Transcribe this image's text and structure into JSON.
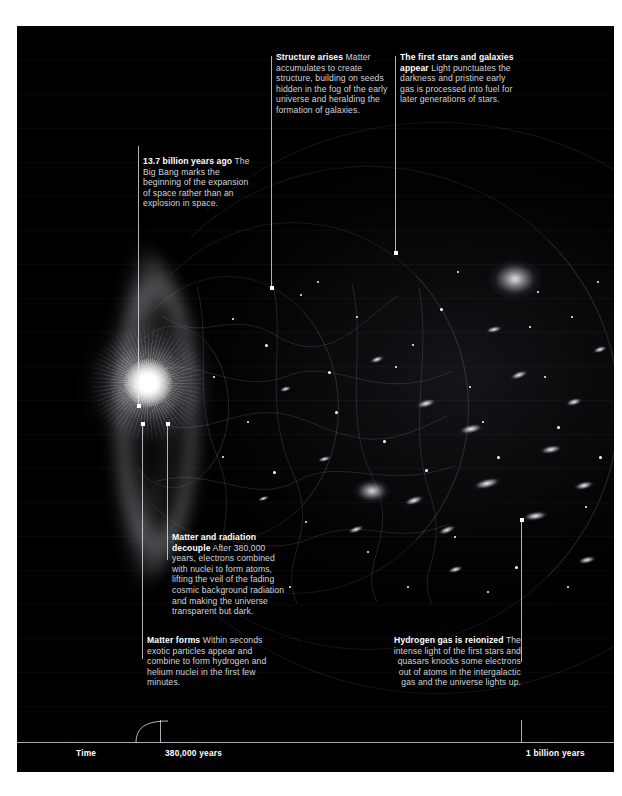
{
  "panel": {
    "background_color": "#000000",
    "page_color": "#ffffff"
  },
  "callouts": [
    {
      "id": "big-bang",
      "title": "13.7 billion years ago",
      "body": "The Big Bang marks the beginning of the expansion of space rather than an explosion in space."
    },
    {
      "id": "structure-arises",
      "title": "Structure arises",
      "body": "Matter accumulates to create structure, building on seeds hidden in the fog of the early universe and heralding the formation of galaxies."
    },
    {
      "id": "first-stars",
      "title": "The first stars and galaxies appear",
      "body": "Light punctuates the darkness and pristine early gas is processed into fuel for later generations of stars."
    },
    {
      "id": "decouple",
      "title": "Matter and radiation decouple",
      "body": "After 380,000 years, electrons combined with nuclei to form atoms, lifting the veil of the fading cosmic background radiation and making the universe transparent but dark."
    },
    {
      "id": "matter-forms",
      "title": "Matter forms",
      "body": "Within seconds exotic particles appear and combine to form hydrogen and helium nuclei in the first few minutes."
    },
    {
      "id": "reionized",
      "title": "Hydrogen gas is reionized",
      "body": "The intense light of the first stars and quasars knocks some electrons out of atoms in the intergalactic gas and the universe lights up."
    }
  ],
  "timeline": {
    "axis_label": "Time",
    "ticks": [
      {
        "label": "380,000 years"
      },
      {
        "label": "1 billion years"
      }
    ]
  }
}
